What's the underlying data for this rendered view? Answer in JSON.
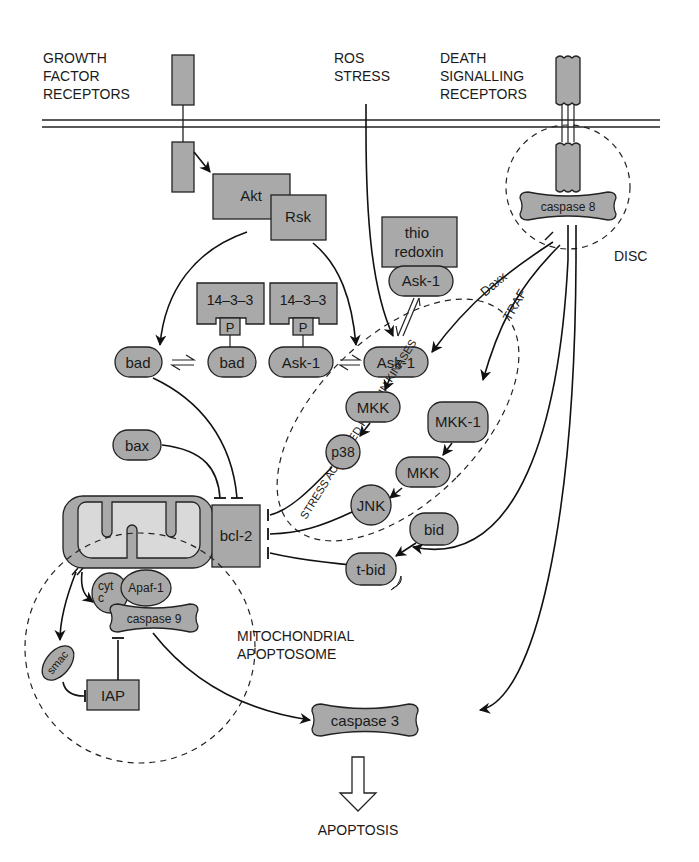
{
  "colors": {
    "node_fill": "#a9a9a9",
    "mito_inner": "#d9d9d9",
    "stroke": "#222222",
    "background": "#ffffff"
  },
  "labels": {
    "growth_factor": [
      "GROWTH",
      "FACTOR",
      "RECEPTORS"
    ],
    "ros_stress": [
      "ROS",
      "STRESS"
    ],
    "death_receptors": [
      "DEATH",
      "SIGNALLING",
      "RECEPTORS"
    ],
    "disc": "DISC",
    "sapk": "STRESS ACTIVATED PROTEIN KINASES",
    "mito_apoptosome": [
      "MITOCHONDRIAL",
      "APOPTOSOME"
    ],
    "daxx": "Daxx",
    "traf": "TRAF",
    "apoptosis": "APOPTOSIS"
  },
  "nodes": {
    "akt": "Akt",
    "rsk": "Rsk",
    "thioredoxin": [
      "thio",
      "redoxin"
    ],
    "ask1_thio": "Ask-1",
    "caspase8": "caspase 8",
    "p1433_a": "14–3–3",
    "p1433_b": "14–3–3",
    "p_a": "P",
    "p_b": "P",
    "bad_free": "bad",
    "bad_bound": "bad",
    "ask1_bound": "Ask-1",
    "ask1_free": "Ask-1",
    "mkk_a": "MKK",
    "mkk1": "MKK-1",
    "p38": "p38",
    "mkk_b": "MKK",
    "jnk": "JNK",
    "bax": "bax",
    "bcl2": "bcl-2",
    "bid": "bid",
    "tbid": "t-bid",
    "cytc": [
      "cyt",
      "c"
    ],
    "apaf1": "Apaf-1",
    "caspase9": "caspase 9",
    "smac": "smac",
    "iap": "IAP",
    "caspase3": "caspase 3"
  }
}
